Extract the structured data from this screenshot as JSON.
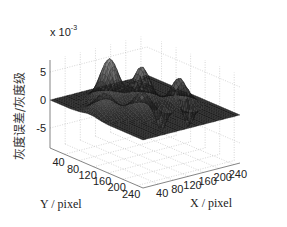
{
  "chart_data": {
    "type": "surface3d",
    "title": "",
    "xlabel": "X / pixel",
    "ylabel": "Y / pixel",
    "zlabel": "灰度误差/灰度级",
    "z_exponent": "x 10",
    "z_exponent_power": "-3",
    "x_ticks": [
      "40",
      "80",
      "120",
      "160",
      "200",
      "240"
    ],
    "y_ticks": [
      "40",
      "80",
      "120",
      "160",
      "200",
      "240"
    ],
    "z_ticks": [
      "5",
      "0",
      "-5"
    ],
    "xlim": [
      0,
      256
    ],
    "ylim": [
      0,
      256
    ],
    "zlim": [
      -8,
      8
    ],
    "grid": true,
    "colormap": "gray",
    "peaks": [
      {
        "x": 96,
        "y": 64,
        "z": 7.5,
        "sigma": 18
      },
      {
        "x": 150,
        "y": 96,
        "z": 6.0,
        "sigma": 16
      },
      {
        "x": 200,
        "y": 150,
        "z": 5.0,
        "sigma": 16
      },
      {
        "x": 200,
        "y": 150,
        "z": -5.5,
        "sigma": 10,
        "offset_y": 20
      },
      {
        "x": 40,
        "y": 110,
        "z": 3.5,
        "sigma": 20
      },
      {
        "x": 100,
        "y": 150,
        "z": 3.8,
        "sigma": 18
      },
      {
        "x": 150,
        "y": 150,
        "z": -4.0,
        "sigma": 10
      }
    ]
  }
}
